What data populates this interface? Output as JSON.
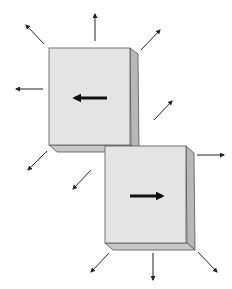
{
  "diagram": {
    "colors": {
      "face": "#e4e4e4",
      "side": "#b8b8b8",
      "bottom": "#c8c8c8",
      "stroke": "#444444",
      "arrow": "#222222",
      "background": "#ffffff"
    },
    "blocks": [
      {
        "name": "upper-left-block",
        "direction": "left"
      },
      {
        "name": "lower-right-block",
        "direction": "right"
      }
    ],
    "outward_arrows_count": 11
  }
}
